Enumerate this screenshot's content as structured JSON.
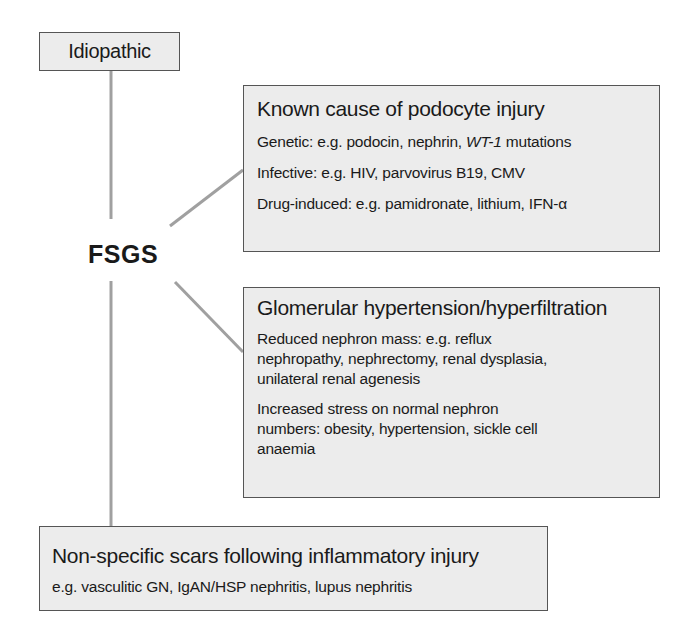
{
  "diagram": {
    "center": {
      "label": "FSGS"
    },
    "idiopathic": {
      "title": "Idiopathic"
    },
    "known_cause": {
      "title": "Known cause of podocyte injury",
      "items": [
        {
          "prefix": "Genetic: e.g. podocin, nephrin, ",
          "italic": "WT-1",
          "suffix": " mutations"
        },
        {
          "text": "Infective: e.g. HIV, parvovirus B19, CMV"
        },
        {
          "text": "Drug-induced: e.g. pamidronate, lithium, IFN-α"
        }
      ]
    },
    "glomerular": {
      "title": "Glomerular hypertension/hyperfiltration",
      "paragraphs": [
        {
          "lines": [
            "Reduced nephron mass: e.g. reflux",
            "nephropathy, nephrectomy, renal dysplasia,",
            "unilateral renal agenesis"
          ]
        },
        {
          "lines": [
            "Increased stress on normal nephron",
            "numbers: obesity, hypertension, sickle cell",
            "anaemia"
          ]
        }
      ]
    },
    "nonspecific": {
      "title": "Non-specific scars following inflammatory injury",
      "text": "e.g. vasculitic GN, IgAN/HSP nephritis, lupus nephritis"
    },
    "colors": {
      "box_fill": "#ececec",
      "box_border": "#555555",
      "connector": "#a0a0a0",
      "text": "#1a1a1a"
    }
  }
}
